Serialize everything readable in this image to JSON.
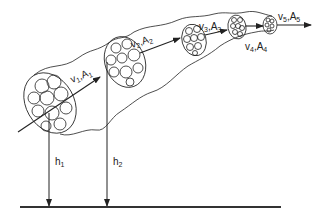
{
  "diagram": {
    "type": "stream-tube",
    "colors": {
      "stroke": "#222222",
      "ground": "#333333",
      "background": "#ffffff"
    },
    "sections": [
      {
        "v": "v",
        "v_sub": "1",
        "A": "A",
        "A_sub": "1"
      },
      {
        "v": "v",
        "v_sub": "2",
        "A": "A",
        "A_sub": "2"
      },
      {
        "v": "v",
        "v_sub": "3",
        "A": "A",
        "A_sub": "3"
      },
      {
        "v": "v",
        "v_sub": "4",
        "A": "A",
        "A_sub": "4"
      },
      {
        "v": "v",
        "v_sub": "5",
        "A": "A",
        "A_sub": "5"
      }
    ],
    "heights": [
      {
        "h": "h",
        "sub": "1"
      },
      {
        "h": "h",
        "sub": "2"
      }
    ],
    "separator": ","
  }
}
